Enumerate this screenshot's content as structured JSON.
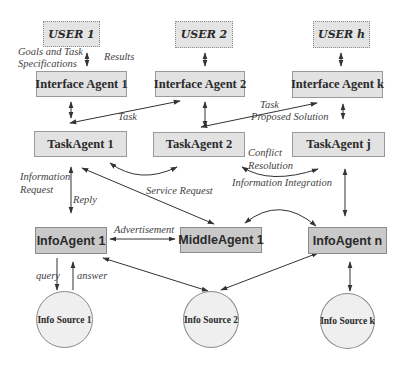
{
  "diagram": {
    "colors": {
      "background": "#ffffff",
      "user_fill": "#e4e4e4",
      "agent_fill": "#e2e2e2",
      "info_agent_fill": "#c9c9c9",
      "source_fill": "#efefef",
      "stroke": "#333333"
    },
    "users": [
      {
        "id": "user-1",
        "label": "USER 1"
      },
      {
        "id": "user-2",
        "label": "USER 2"
      },
      {
        "id": "user-h",
        "label": "USER h"
      }
    ],
    "interface_agents": [
      {
        "id": "interface-agent-1",
        "label": "Interface Agent 1"
      },
      {
        "id": "interface-agent-2",
        "label": "Interface Agent 2"
      },
      {
        "id": "interface-agent-k",
        "label": "Interface Agent k"
      }
    ],
    "task_agents": [
      {
        "id": "task-agent-1",
        "label": "TaskAgent 1"
      },
      {
        "id": "task-agent-2",
        "label": "TaskAgent 2"
      },
      {
        "id": "task-agent-j",
        "label": "TaskAgent j"
      }
    ],
    "info_layer": [
      {
        "id": "info-agent-1",
        "label": "InfoAgent 1"
      },
      {
        "id": "middle-agent-1",
        "label": "MiddleAgent 1"
      },
      {
        "id": "info-agent-n",
        "label": "InfoAgent n"
      }
    ],
    "sources": [
      {
        "id": "info-source-1",
        "label": "Info Source 1"
      },
      {
        "id": "info-source-2",
        "label": "Info Source 2"
      },
      {
        "id": "info-source-k",
        "label": "Info Source k"
      }
    ],
    "edge_labels": {
      "goals": "Goals and Task",
      "specs": "Specifications",
      "results": "Results",
      "task_1": "Task",
      "task_2": "Task",
      "proposed_solution": "Proposed Solution",
      "conflict": "Conflict",
      "resolution": "Resolution",
      "information_integration": "Information Integration",
      "information": "Information",
      "request": "Request",
      "reply": "Reply",
      "service_request": "Service Request",
      "advertisement": "Advertisement",
      "query": "query",
      "answer": "answer"
    }
  }
}
